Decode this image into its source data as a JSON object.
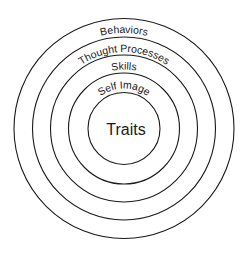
{
  "diagram": {
    "type": "concentric-circles",
    "layers": [
      {
        "label": "Behaviors",
        "level": 1
      },
      {
        "label": "Thought Processes",
        "level": 2
      },
      {
        "label": "Skills",
        "level": 3
      },
      {
        "label": "Self Image",
        "level": 4
      }
    ],
    "core": {
      "label": "Traits"
    },
    "colors": {
      "stroke": "#1a1a1a",
      "background": "#ffffff"
    }
  }
}
